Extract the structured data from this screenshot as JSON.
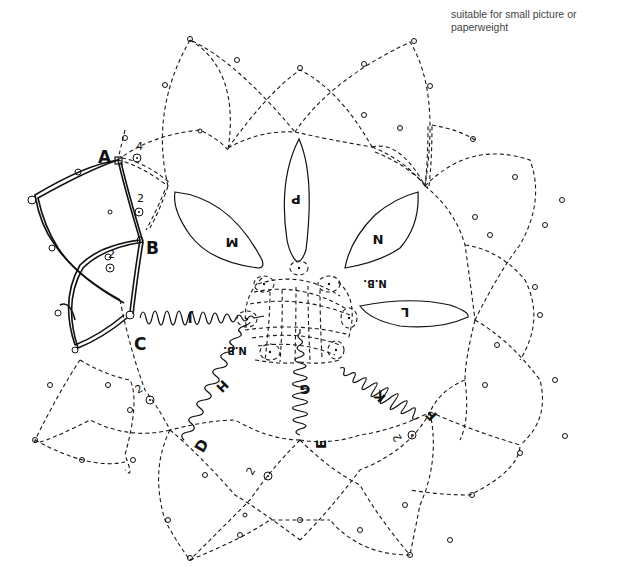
{
  "caption": {
    "line1": "suitable for small picture or",
    "line2": "paperweight"
  },
  "diagram": {
    "type": "tatting-lace-pattern",
    "point_labels": {
      "A": "A",
      "B": "B",
      "C": "C",
      "D": "D",
      "E": "E",
      "F": "F"
    },
    "petals": [
      {
        "id": "P",
        "label": "P"
      },
      {
        "id": "M",
        "label": "M"
      },
      {
        "id": "N",
        "label": "N"
      },
      {
        "id": "L",
        "label": "L"
      }
    ],
    "coils": [
      {
        "id": "J",
        "label": "J"
      },
      {
        "id": "H",
        "label": "H"
      },
      {
        "id": "G",
        "label": "G"
      },
      {
        "id": "K",
        "label": "K"
      }
    ],
    "notes": [
      {
        "id": "nb1",
        "label": "N.B."
      },
      {
        "id": "nb2",
        "label": "N.B."
      }
    ],
    "counts": [
      {
        "id": "count-a",
        "value": "4"
      },
      {
        "id": "count-ab",
        "value": "2"
      },
      {
        "id": "count-bc",
        "value": "2"
      },
      {
        "id": "count-cd",
        "value": "2"
      },
      {
        "id": "count-de",
        "value": "2"
      },
      {
        "id": "count-ef",
        "value": "2"
      }
    ],
    "dot_symbol": "⊙"
  }
}
